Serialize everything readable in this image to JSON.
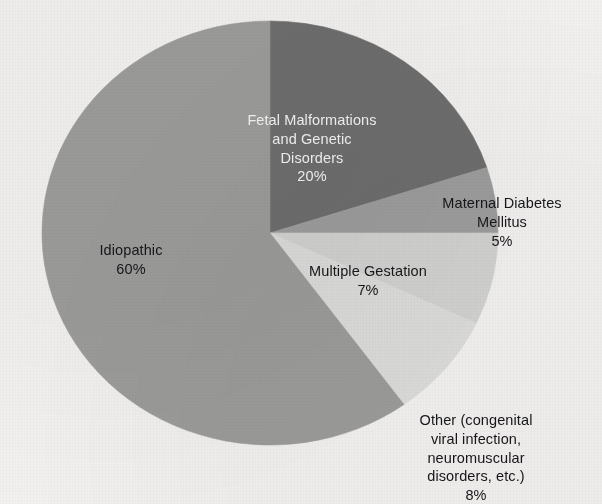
{
  "chart_data": {
    "type": "pie",
    "title": "",
    "subtitle": "",
    "xlabel": "",
    "ylabel": "",
    "legend_position": "none",
    "grid": false,
    "labels_on_slices": true,
    "start_angle_deg": 0,
    "direction": "clockwise",
    "categories": [
      "Fetal Malformations and Genetic Disorders",
      "Maternal Diabetes Mellitus",
      "Multiple Gestation",
      "Other (congenital viral infection, neuromuscular disorders, etc.)",
      "Idiopathic"
    ],
    "values": [
      20,
      5,
      7,
      8,
      60
    ],
    "units": "percent",
    "total": 100,
    "slices": [
      {
        "id": "fetal",
        "label": "Fetal Malformations\nand Genetic\nDisorders",
        "label_flat": "Fetal Malformations and Genetic Disorders",
        "value": 20,
        "percent_text": "20%",
        "color": "#6e6e6e",
        "label_color": "light",
        "start_deg": 0,
        "end_deg": 72
      },
      {
        "id": "maternal",
        "label": "Maternal Diabetes\nMellitus",
        "label_flat": "Maternal Diabetes Mellitus",
        "value": 5,
        "percent_text": "5%",
        "color": "#9d9d9d",
        "label_color": "dark",
        "start_deg": 72,
        "end_deg": 90
      },
      {
        "id": "multiple",
        "label": "Multiple Gestation",
        "label_flat": "Multiple Gestation",
        "value": 7,
        "percent_text": "7%",
        "color": "#d2d2d0",
        "label_color": "dark",
        "start_deg": 90,
        "end_deg": 115.2
      },
      {
        "id": "other",
        "label": "Other (congenital\nviral infection,\nneuromuscular\ndisorders, etc.)",
        "label_flat": "Other (congenital viral infection, neuromuscular disorders, etc.)",
        "value": 8,
        "percent_text": "8%",
        "color": "#dcdcda",
        "label_color": "dark",
        "start_deg": 115.2,
        "end_deg": 144
      },
      {
        "id": "idiopathic",
        "label": "Idiopathic",
        "label_flat": "Idiopathic",
        "value": 60,
        "percent_text": "60%",
        "color": "#9c9c9a",
        "label_color": "dark",
        "start_deg": 144,
        "end_deg": 360
      }
    ],
    "colors": {
      "background": "#f2f1ef",
      "fetal": "#6e6e6e",
      "maternal": "#9d9d9d",
      "multiple": "#d2d2d0",
      "other": "#dcdcda",
      "idiopathic": "#9c9c9a",
      "text_dark": "#17161a",
      "text_light": "#f4f4f4"
    },
    "geometry": {
      "center_x": 270,
      "center_y": 233,
      "radius_x": 228,
      "radius_y": 212
    }
  }
}
